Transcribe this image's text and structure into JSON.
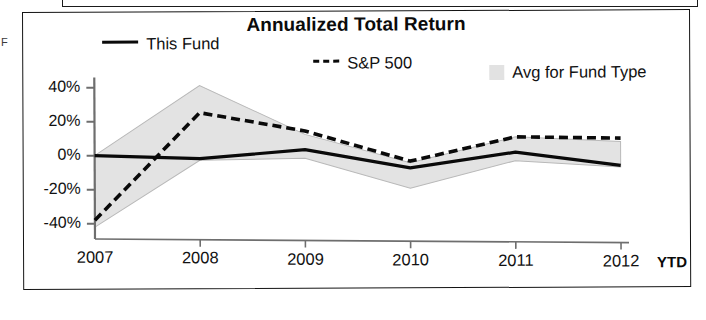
{
  "chart_data": {
    "type": "line",
    "title": "Annualized Total Return",
    "xlabel": "",
    "ylabel": "",
    "x": [
      "2007",
      "2008",
      "2009",
      "2010",
      "2011",
      "2012"
    ],
    "x_tick_labels": [
      "2007",
      "2008",
      "2009",
      "2010",
      "2011",
      "2012"
    ],
    "x_axis_suffix": "YTD",
    "y_tick_labels": [
      "40%",
      "20%",
      "0%",
      "-20%",
      "-40%"
    ],
    "y_tick_values": [
      40,
      20,
      0,
      -20,
      -40
    ],
    "ylim": [
      -48,
      45
    ],
    "grid": false,
    "legend_position": "top",
    "series": [
      {
        "name": "This Fund",
        "style": "solid",
        "color": "#0a0a0a",
        "values": [
          0,
          -2,
          3,
          -8,
          1,
          -7
        ]
      },
      {
        "name": "S&P 500",
        "style": "dashed",
        "color": "#0a0a0a",
        "values": [
          -38,
          25,
          14,
          -4,
          10,
          9
        ]
      },
      {
        "name": "Avg for Fund Type",
        "style": "band",
        "color": "#e3e3e3",
        "upper": [
          0,
          41,
          12,
          -5,
          10,
          7
        ],
        "lower": [
          -42,
          -3,
          -2,
          -20,
          -4,
          -8
        ]
      }
    ],
    "legend": [
      {
        "label": "This Fund",
        "marker": "solid-line"
      },
      {
        "label": "S&P 500",
        "marker": "dashed-line"
      },
      {
        "label": "Avg for Fund Type",
        "marker": "shaded-band"
      }
    ],
    "colors": {
      "line": "#0a0a0a",
      "band_fill": "#e3e3e3",
      "band_stroke": "#b8b8b8",
      "axis": "#6e6e6e",
      "frame": "#141414"
    }
  },
  "fragments": {
    "left_edge_text": "F"
  }
}
